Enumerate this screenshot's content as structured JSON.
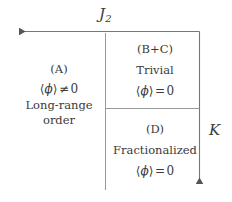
{
  "figure": {
    "type": "phase-diagram",
    "background_color": "#ffffff",
    "line_color": "#777777",
    "text_color": "#3a3a3a"
  },
  "axes": {
    "horizontal": {
      "label_base": "J",
      "label_sub": "2",
      "direction": "left",
      "description": "horizontal axis arrow pointing left, labeled J2"
    },
    "vertical": {
      "label": "K",
      "direction": "down",
      "description": "vertical axis arrow pointing down, labeled K"
    }
  },
  "regions": [
    {
      "id": "A",
      "tag": "(A)",
      "order_parameter_bra": "⟨",
      "order_parameter_symbol": "ϕ",
      "order_parameter_ket": "⟩",
      "relation": "≠",
      "order_parameter_value": "0",
      "name_line1": "Long-range",
      "name_line2": "order"
    },
    {
      "id": "B+C",
      "tag": "(B+C)",
      "name": "Trivial",
      "order_parameter_bra": "⟨",
      "order_parameter_symbol": "ϕ",
      "order_parameter_ket": "⟩",
      "relation": "=",
      "order_parameter_value": "0"
    },
    {
      "id": "D",
      "tag": "(D)",
      "name": "Fractionalized",
      "order_parameter_bra": "⟨",
      "order_parameter_symbol": "ϕ",
      "order_parameter_ket": "⟩",
      "relation": "=",
      "order_parameter_value": "0"
    }
  ]
}
